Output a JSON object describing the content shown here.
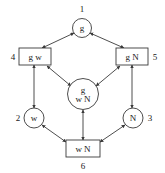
{
  "diagram": {
    "type": "lattice-diagram",
    "colors": {
      "background": "#ffffff",
      "stroke": "#3a3a3a",
      "text": "#1a1a1a"
    },
    "nodes": [
      {
        "id": "node-1",
        "index": "1",
        "shape": "circle",
        "lines": [
          "g"
        ],
        "cx": 82,
        "cy": 28,
        "r": 9.5,
        "index_x": 82,
        "index_y": 12,
        "index_anchor": "middle"
      },
      {
        "id": "node-4",
        "index": "4",
        "shape": "rect",
        "lines": [
          "g  w"
        ],
        "x": 19,
        "y": 48,
        "w": 32,
        "h": 17,
        "index_x": 13,
        "index_y": 60,
        "index_anchor": "middle"
      },
      {
        "id": "node-5",
        "index": "5",
        "shape": "rect",
        "lines": [
          "g  N"
        ],
        "x": 116,
        "y": 48,
        "w": 32,
        "h": 17,
        "index_x": 155,
        "index_y": 60,
        "index_anchor": "middle"
      },
      {
        "id": "node-7",
        "index": "",
        "shape": "circle",
        "lines": [
          "g",
          "w N"
        ],
        "cx": 83,
        "cy": 94,
        "r": 15.5,
        "index_x": 0,
        "index_y": 0,
        "index_anchor": "middle"
      },
      {
        "id": "node-2",
        "index": "2",
        "shape": "circle",
        "lines": [
          "w"
        ],
        "cx": 34,
        "cy": 118,
        "r": 10,
        "index_x": 18,
        "index_y": 121,
        "index_anchor": "middle"
      },
      {
        "id": "node-3",
        "index": "3",
        "shape": "circle",
        "lines": [
          "N"
        ],
        "cx": 133,
        "cy": 118,
        "r": 10,
        "index_x": 150,
        "index_y": 121,
        "index_anchor": "middle"
      },
      {
        "id": "node-6",
        "index": "6",
        "shape": "rect",
        "lines": [
          "w  N"
        ],
        "x": 66,
        "y": 140,
        "w": 34,
        "h": 17,
        "index_x": 83,
        "index_y": 169,
        "index_anchor": "middle"
      }
    ],
    "edges": [
      {
        "id": "edge-4-1",
        "from": "node-4",
        "to": "node-1",
        "x1": 42,
        "y1": 48,
        "x2": 74,
        "y2": 33,
        "arrows": "both"
      },
      {
        "id": "edge-1-5",
        "from": "node-1",
        "to": "node-5",
        "x1": 90,
        "y1": 33,
        "x2": 124,
        "y2": 48,
        "arrows": "both"
      },
      {
        "id": "edge-4-2",
        "from": "node-4",
        "to": "node-2",
        "x1": 34,
        "y1": 65,
        "x2": 34,
        "y2": 108,
        "arrows": "both"
      },
      {
        "id": "edge-5-3",
        "from": "node-5",
        "to": "node-3",
        "x1": 132,
        "y1": 65,
        "x2": 132,
        "y2": 108,
        "arrows": "both"
      },
      {
        "id": "edge-4-7",
        "from": "node-4",
        "to": "node-7",
        "x1": 47,
        "y1": 66,
        "x2": 71,
        "y2": 86,
        "arrows": "both"
      },
      {
        "id": "edge-7-5",
        "from": "node-7",
        "to": "node-5",
        "x1": 96,
        "y1": 86,
        "x2": 120,
        "y2": 66,
        "arrows": "both"
      },
      {
        "id": "edge-7-6",
        "from": "node-7",
        "to": "node-6",
        "x1": 83,
        "y1": 110,
        "x2": 83,
        "y2": 140,
        "arrows": "both"
      },
      {
        "id": "edge-2-6",
        "from": "node-2",
        "to": "node-6",
        "x1": 42,
        "y1": 125,
        "x2": 66,
        "y2": 142,
        "arrows": "both"
      },
      {
        "id": "edge-6-3",
        "from": "node-6",
        "to": "node-3",
        "x1": 100,
        "y1": 142,
        "x2": 125,
        "y2": 125,
        "arrows": "both"
      }
    ]
  }
}
